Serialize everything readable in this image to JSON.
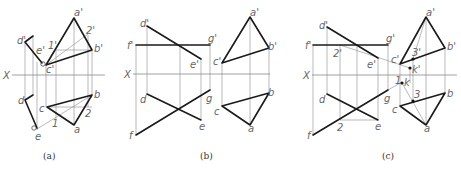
{
  "panels": [
    {
      "caption": "(a)",
      "axis_label": "X",
      "labels": {
        "a_prime": "a'",
        "b_prime": "b'",
        "c_prime": "c'",
        "d_prime": "d'",
        "e_prime": "e'",
        "one_prime": "1'",
        "two_prime": "2'",
        "a": "a",
        "b": "b",
        "c": "c",
        "d": "d",
        "e": "e",
        "one": "1",
        "two": "2"
      }
    },
    {
      "caption": "(b)",
      "axis_label": "X",
      "labels": {
        "d_prime": "d'",
        "e_prime": "e'",
        "f_prime": "f'",
        "g_prime": "g'",
        "d": "d",
        "e": "e",
        "f": "f",
        "g": "g",
        "a_prime": "a'",
        "b_prime": "b'",
        "c_prime": "c'",
        "a": "a",
        "b": "b",
        "c": "c"
      }
    },
    {
      "caption": "(c)",
      "axis_label": "X",
      "labels": {
        "d_prime": "d'",
        "e_prime": "e'",
        "f_prime": "f'",
        "g_prime": "g'",
        "two_prime": "2'",
        "d": "d",
        "e": "e",
        "f": "f",
        "g": "g",
        "two": "2",
        "a_prime": "a'",
        "b_prime": "b'",
        "c_prime": "c'",
        "three_prime": "3'",
        "k_prime": "k'",
        "a": "a",
        "b": "b",
        "c": "c",
        "three": "3",
        "one_k": "1",
        "k": "k"
      }
    }
  ]
}
